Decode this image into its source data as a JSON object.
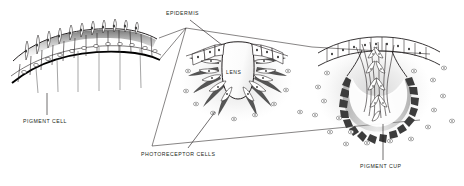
{
  "figure": {
    "background_color": "#ffffff",
    "ink_color": "#231f20",
    "pigment_color": "#4a4a4a",
    "shade_color": "#8a8a8a",
    "width": 464,
    "height": 186
  },
  "labels": {
    "epidermis": "EPIDERMIS",
    "pigment_cell": "PIGMENT CELL",
    "lens": "LENS",
    "photoreceptor_cells": "PHOTORECEPTOR CELLS",
    "pigment_cup": "PIGMENT CUP"
  },
  "panels": [
    {
      "name": "flat-eyespot",
      "stage": 1,
      "description": "Flat arched epithelium with pigment cells and photoreceptor cells",
      "position": "left"
    },
    {
      "name": "cup-with-lens",
      "stage": 2,
      "description": "Invaginated cup containing a central lens surrounded by photoreceptor cells",
      "position": "center"
    },
    {
      "name": "pigment-cup-eye",
      "stage": 3,
      "description": "Deep pigment cup eye with nerve fibre bundle and scattered pigment cells",
      "position": "right"
    }
  ],
  "leader_lines": [
    {
      "name": "epidermis-leader",
      "from": "EPIDERMIS",
      "to": "center-panel-epithelium"
    },
    {
      "name": "pigment-cell-leader",
      "from": "PIGMENT CELL",
      "to": "left-panel-pigment-cell"
    },
    {
      "name": "photoreceptor-leader",
      "from": "PHOTORECEPTOR CELLS",
      "to": "center-panel-receptors"
    },
    {
      "name": "pigment-cup-leader",
      "from": "PIGMENT CUP",
      "to": "right-panel-cup"
    }
  ]
}
